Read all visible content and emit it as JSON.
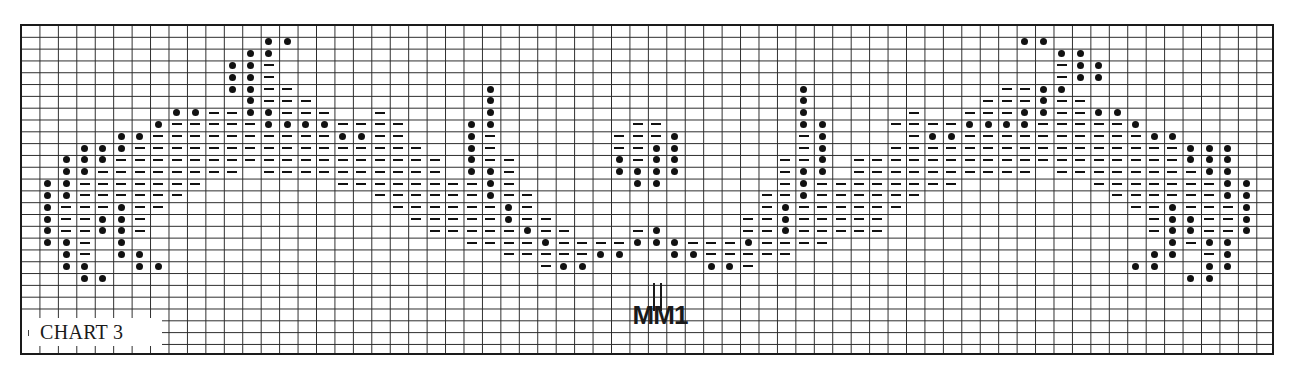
{
  "title": "CHART 3",
  "marker": "MM1",
  "legend": {
    "dot": "filled-circle stitch",
    "dash": "dash stitch",
    "empty": "blank square"
  },
  "colors": {
    "ink": "#111111",
    "grid": "#2a2a2a",
    "background": "#ffffff"
  },
  "chart_data": {
    "type": "table",
    "title": "CHART 3",
    "annotation": "MM1",
    "columns": 68,
    "rows": 28,
    "encoding": {
      "o": "dot",
      "-": "dash",
      ".": "empty"
    },
    "grid": [
      "....................................................................",
      ".............oo.......................................oo............",
      "............oo..........................................oo..........",
      "...........oo-..........................................-oo.........",
      "...........oo-..........................................-oo.........",
      "...........oo--..........o................o..........--oo...........",
      "............o---.........o................o.........---o--..........",
      "........oo--oo---..-.....o................o.....-..---oo--oo........",
      ".......o-----oooo----...oo.......--.......oo...----oooo-----o.......",
      ".....oo----------oo--...o-......---o......-o....-oo----------oo.....",
      "...ooo----------------..o-......--oo......-o...----------------ooo...",
      "..ooo------------------.o--.....o-oo.....--o.------------------ooo..",
      "..oo--------.----------.oo-.....oooo.....-oo.----------.--------oo..",
      ".oo-------.......--------o-......oo......-o--------.......-------oo.",
      ".oo------..........------o--............--o------..........------oo.",
      ".o---o--............------o-............-o------............--o---o.",
      ".o--oo-..............-----o--..........--o-----..............-oo--o.",
      ".o--oo-...............-----o--...-o....--o-----..............-oo--o.",
      ".oo-.o..................----o----ooo---o----..................o-oo.",
      "..o-.oo...................-----oo..oo-----...................oo.-o..",
      "..oo..oo....................-oo......oo-....................oo..oo..",
      "...oo..........................................................oo...",
      "....................................................................",
      "....................................................................",
      "....................................................................",
      "....................................................................",
      "....................................................................",
      "...................................................................."
    ]
  }
}
